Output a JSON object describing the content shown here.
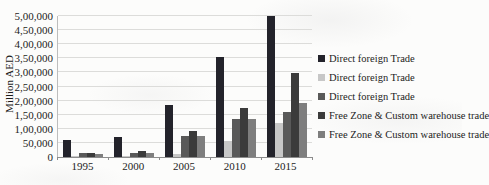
{
  "chart_data": {
    "type": "bar",
    "title": "",
    "xlabel": "",
    "ylabel": "Million AED",
    "categories": [
      "1995",
      "2000",
      "2005",
      "2010",
      "2015"
    ],
    "series": [
      {
        "name": "Direct foreign Trade",
        "color": "#23232b",
        "values": [
          62000,
          72000,
          185000,
          355000,
          500000
        ]
      },
      {
        "name": "Direct foreign Trade",
        "color": "#c7c7c7",
        "values": [
          4000,
          5000,
          10000,
          57000,
          120000
        ]
      },
      {
        "name": "Direct foreign Trade",
        "color": "#595959",
        "values": [
          14000,
          14000,
          73000,
          135000,
          160000
        ]
      },
      {
        "name": "Free Zone & Custom warehouse trade",
        "color": "#3b3b3b",
        "values": [
          16000,
          21000,
          93000,
          173000,
          298000
        ]
      },
      {
        "name": "Free Zone & Custom warehouse trade",
        "color": "#7e7e7e",
        "values": [
          12000,
          14000,
          74000,
          136000,
          192000
        ]
      }
    ],
    "ylim": [
      0,
      500000
    ],
    "ytick_step": 50000,
    "ytick_labels": [
      "0",
      "50,000",
      "1,00,000",
      "1,50,000",
      "2,00,000",
      "2,50,000",
      "3,00,000",
      "3,50,000",
      "4,00,000",
      "4,50,000",
      "5,00,000"
    ],
    "grid": true,
    "legend_position": "right"
  }
}
